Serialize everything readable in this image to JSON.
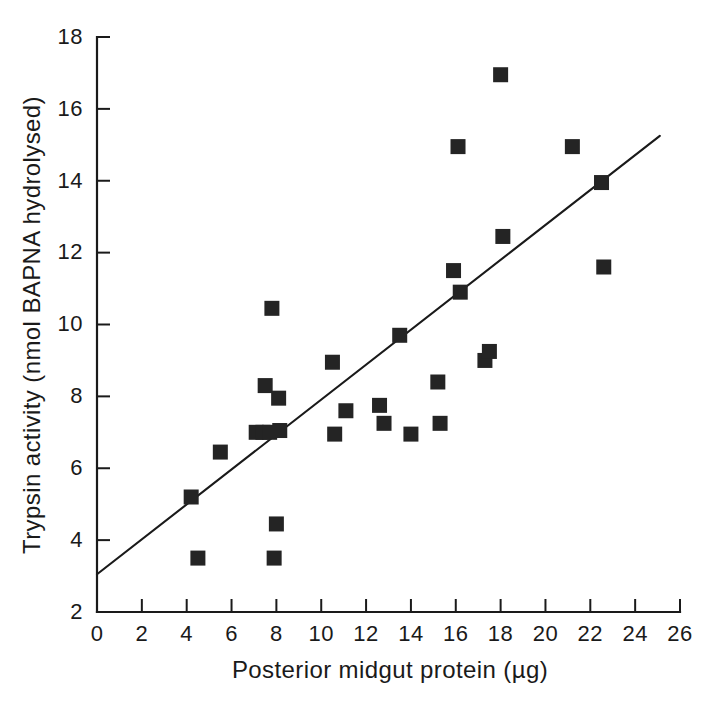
{
  "chart_data": {
    "type": "scatter",
    "title": "",
    "xlabel": "Posterior midgut protein (µg)",
    "ylabel": "Trypsin activity (nmol BAPNA hydrolysed)",
    "xlim": [
      0,
      26
    ],
    "ylim": [
      2,
      18
    ],
    "xticks": [
      0,
      2,
      4,
      6,
      8,
      10,
      12,
      14,
      16,
      18,
      20,
      22,
      24,
      26
    ],
    "yticks": [
      2,
      4,
      6,
      8,
      10,
      12,
      14,
      16,
      18
    ],
    "xtick_labels": [
      "0",
      "2",
      "4",
      "6",
      "8",
      "10",
      "12",
      "14",
      "16",
      "18",
      "20",
      "22",
      "24",
      "26"
    ],
    "ytick_labels": [
      "2",
      "4",
      "6",
      "8",
      "10",
      "12",
      "14",
      "16",
      "18"
    ],
    "grid": false,
    "legend": null,
    "marker": "filled-square",
    "marker_color": "#242424",
    "axis_color": "#1a1a1a",
    "background": "#ffffff",
    "points": [
      {
        "x": 4.2,
        "y": 5.2
      },
      {
        "x": 4.5,
        "y": 3.5
      },
      {
        "x": 5.5,
        "y": 6.45
      },
      {
        "x": 7.1,
        "y": 7.0
      },
      {
        "x": 7.4,
        "y": 7.0
      },
      {
        "x": 7.5,
        "y": 8.3
      },
      {
        "x": 7.7,
        "y": 7.0
      },
      {
        "x": 7.8,
        "y": 10.45
      },
      {
        "x": 7.9,
        "y": 3.5
      },
      {
        "x": 8.0,
        "y": 4.45
      },
      {
        "x": 8.1,
        "y": 7.95
      },
      {
        "x": 8.15,
        "y": 7.05
      },
      {
        "x": 10.5,
        "y": 8.95
      },
      {
        "x": 10.6,
        "y": 6.95
      },
      {
        "x": 11.1,
        "y": 7.6
      },
      {
        "x": 12.6,
        "y": 7.75
      },
      {
        "x": 12.8,
        "y": 7.25
      },
      {
        "x": 13.5,
        "y": 9.7
      },
      {
        "x": 14.0,
        "y": 6.95
      },
      {
        "x": 15.2,
        "y": 8.4
      },
      {
        "x": 15.3,
        "y": 7.25
      },
      {
        "x": 15.9,
        "y": 11.5
      },
      {
        "x": 16.1,
        "y": 14.95
      },
      {
        "x": 16.2,
        "y": 10.9
      },
      {
        "x": 17.3,
        "y": 9.0
      },
      {
        "x": 17.5,
        "y": 9.25
      },
      {
        "x": 18.0,
        "y": 16.95
      },
      {
        "x": 18.1,
        "y": 12.45
      },
      {
        "x": 21.2,
        "y": 14.95
      },
      {
        "x": 22.5,
        "y": 13.95
      },
      {
        "x": 22.6,
        "y": 11.6
      }
    ],
    "fit_line": {
      "x_start": 0.0,
      "y_start": 3.05,
      "x_end": 25.1,
      "y_end": 15.25
    }
  }
}
